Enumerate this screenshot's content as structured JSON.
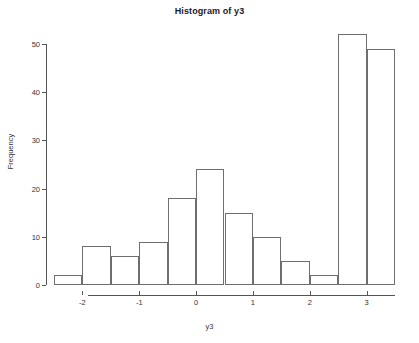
{
  "chart_data": {
    "type": "bar",
    "title": "Histogram of y3",
    "xlabel": "y3",
    "ylabel": "Frequency",
    "bin_width": 0.5,
    "bin_edges": [
      -2.5,
      -2.0,
      -1.5,
      -1.0,
      -0.5,
      0.0,
      0.5,
      1.0,
      1.5,
      2.0,
      2.5,
      3.0,
      3.5
    ],
    "categories": [
      "[-2.5,-2.0)",
      "[-2.0,-1.5)",
      "[-1.5,-1.0)",
      "[-1.0,-0.5)",
      "[-0.5,0.0)",
      "[0.0,0.5)",
      "[0.5,1.0)",
      "[1.0,1.5)",
      "[1.5,2.0)",
      "[2.0,2.5)",
      "[2.5,3.0)",
      "[3.0,3.5)"
    ],
    "values": [
      2,
      8,
      6,
      9,
      18,
      24,
      15,
      10,
      5,
      2,
      52,
      49
    ],
    "xlim": [
      -2.5,
      3.5
    ],
    "ylim": [
      0,
      52
    ],
    "x_ticks": [
      -2,
      -1,
      0,
      1,
      2,
      3
    ],
    "x_tick_labels": [
      "-2",
      "-1",
      "0",
      "1",
      "2",
      "3"
    ],
    "y_ticks": [
      0,
      10,
      20,
      30,
      40,
      50
    ],
    "y_tick_labels": [
      "0",
      "10",
      "20",
      "30",
      "40",
      "50"
    ],
    "grid": false,
    "legend": null,
    "bar_fill": "#ffffff",
    "bar_stroke": "#6e6e6e",
    "axis_color": "#555555",
    "text_color": "#333333",
    "background": "#ffffff"
  }
}
